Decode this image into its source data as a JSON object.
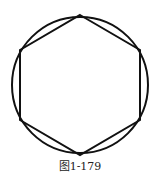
{
  "figure": {
    "caption": "图1-179",
    "stroke_color": "#111111",
    "circle": {
      "cx": 80,
      "cy": 85,
      "r": 68
    },
    "hexagon_points": "80,15 140,50 140,120 80,155 20,120 20,50"
  }
}
